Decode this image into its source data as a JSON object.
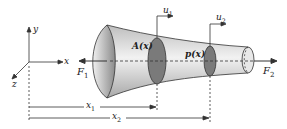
{
  "diagram": {
    "type": "tapered-bar-axial-load",
    "axes": {
      "x": "x",
      "y": "y",
      "z": "z"
    },
    "forces": {
      "left": "F",
      "left_sub": "1",
      "right": "F",
      "right_sub": "2"
    },
    "displacements": {
      "u1": "u",
      "u1_sub": "1",
      "u2": "u",
      "u2_sub": "2"
    },
    "section_labels": {
      "area": "A(x)",
      "load": "p(x)"
    },
    "dimensions": {
      "x1": "x",
      "x1_sub": "1",
      "x2": "x",
      "x2_sub": "2"
    },
    "colors": {
      "stroke": "#333333",
      "body_light": "#e6e6e6",
      "body_dark": "#9a9a9a",
      "section": "#7a7a7a"
    }
  }
}
